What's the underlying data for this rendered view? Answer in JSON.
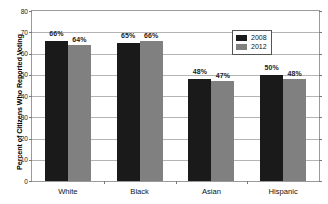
{
  "chart_data": {
    "type": "bar",
    "title": "",
    "xlabel": "",
    "ylabel": "Percent of Citizens Who Reported Voting",
    "ylim": [
      0,
      80
    ],
    "yticks": [
      0,
      10,
      20,
      30,
      40,
      50,
      60,
      70,
      80
    ],
    "grid": true,
    "legend_position": "top-right",
    "categories": [
      "White",
      "Black",
      "Asian",
      "Hispanic"
    ],
    "series": [
      {
        "name": "2008",
        "color": "#1a1a1a",
        "values": [
          66,
          65,
          48,
          50
        ],
        "labels": [
          "66%",
          "65%",
          "48%",
          "50%"
        ]
      },
      {
        "name": "2012",
        "color": "#808080",
        "values": [
          64,
          66,
          47,
          48
        ],
        "labels": [
          "64%",
          "66%",
          "47%",
          "48%"
        ]
      }
    ]
  },
  "axis": {
    "y_title": "Percent of Citizens Who Reported Voting",
    "y_tick_labels": [
      "80",
      "70",
      "60",
      "50",
      "40",
      "30",
      "20",
      "10",
      "0"
    ],
    "x_tick_labels": [
      "White",
      "Black",
      "Asian",
      "Hispanic"
    ]
  },
  "legend": {
    "entries": [
      {
        "label": "2008",
        "color": "#1a1a1a"
      },
      {
        "label": "2012",
        "color": "#808080"
      }
    ]
  },
  "colors": {
    "series_2008": "#1a1a1a",
    "series_2012": "#808080",
    "gridline": "#b4b4b4",
    "frame": "#9a9a9a",
    "background": "#ffffff"
  }
}
